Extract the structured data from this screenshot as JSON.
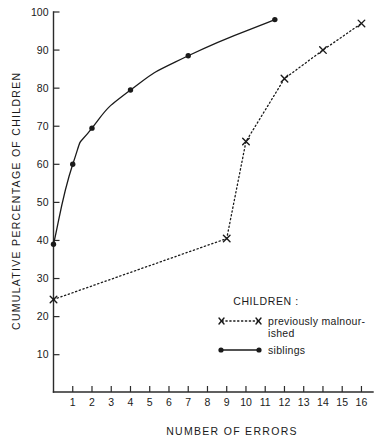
{
  "chart_data": {
    "type": "line",
    "title": "",
    "xlabel": "NUMBER  OF  ERRORS",
    "ylabel": "CUMULATIVE  PERCENTAGE  OF  CHILDREN",
    "xlim": [
      0,
      16.6
    ],
    "ylim": [
      0.2,
      100
    ],
    "grid": false,
    "x_ticks": [
      1,
      2,
      3,
      4,
      5,
      6,
      7,
      8,
      9,
      10,
      11,
      12,
      13,
      14,
      15,
      16
    ],
    "y_ticks": [
      10,
      20,
      30,
      40,
      50,
      60,
      70,
      80,
      90,
      100
    ],
    "legend_position": "inside-lower-right",
    "legend_title": "CHILDREN :",
    "series": [
      {
        "name": "previously malnourished",
        "label_line1": "previously  malnour-",
        "label_line2": "ished",
        "marker": "x",
        "linestyle": "dotted",
        "color": "#1a1a1a",
        "points": [
          {
            "x": 0,
            "y": 24.5
          },
          {
            "x": 9,
            "y": 40.5
          },
          {
            "x": 10,
            "y": 66
          },
          {
            "x": 12,
            "y": 82.5
          },
          {
            "x": 14,
            "y": 90
          },
          {
            "x": 16,
            "y": 97
          }
        ]
      },
      {
        "name": "siblings",
        "label_line1": "siblings",
        "label_line2": "",
        "marker": "dot",
        "linestyle": "solid",
        "color": "#1a1a1a",
        "points": [
          {
            "x": 0,
            "y": 39
          },
          {
            "x": 1,
            "y": 60
          },
          {
            "x": 2,
            "y": 69.5
          },
          {
            "x": 4,
            "y": 79.5
          },
          {
            "x": 7,
            "y": 88.5
          },
          {
            "x": 11.5,
            "y": 98
          }
        ]
      }
    ]
  },
  "axes": {
    "y_title": "CUMULATIVE  PERCENTAGE  OF  CHILDREN",
    "x_title": "NUMBER  OF  ERRORS"
  },
  "legend": {
    "heading": "CHILDREN :",
    "entries": [
      {
        "label_1": "previously  malnour-",
        "label_2": "ished",
        "swatch": "x-dotted-x"
      },
      {
        "label_1": "siblings",
        "label_2": "",
        "swatch": "dot-solid-dot"
      }
    ]
  }
}
